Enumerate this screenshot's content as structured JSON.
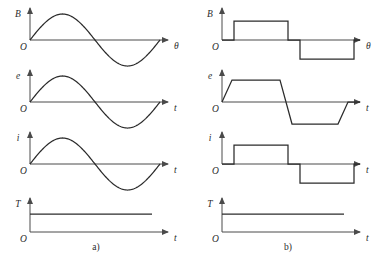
{
  "figure": {
    "width": 387,
    "height": 259,
    "background": "#ffffff",
    "curve_color": "#2b2b2b",
    "axis_color": "#4a4a4a"
  },
  "captions": [
    {
      "id": "caption-a",
      "label": "a)",
      "x": 96,
      "y": 250
    },
    {
      "id": "caption-b",
      "label": "b)",
      "x": 288,
      "y": 250
    }
  ],
  "origin_label": "O",
  "panels": [
    {
      "id": "panel-a-B",
      "column": "a",
      "y_label": "B",
      "x_label": "θ",
      "origin": {
        "x": 30,
        "y": 40
      },
      "x_axis_end": 168,
      "y_axis_top": 8,
      "wave": "sine",
      "amplitude": 26,
      "period": 130,
      "wave_start": 30,
      "wave_end": 160
    },
    {
      "id": "panel-a-e",
      "column": "a",
      "y_label": "e",
      "x_label": "t",
      "origin": {
        "x": 30,
        "y": 102
      },
      "x_axis_end": 168,
      "y_axis_top": 70,
      "wave": "sine",
      "amplitude": 26,
      "period": 130,
      "wave_start": 30,
      "wave_end": 160
    },
    {
      "id": "panel-a-i",
      "column": "a",
      "y_label": "i",
      "x_label": "t",
      "origin": {
        "x": 30,
        "y": 164
      },
      "x_axis_end": 168,
      "y_axis_top": 132,
      "wave": "sine",
      "amplitude": 26,
      "period": 130,
      "wave_start": 30,
      "wave_end": 160
    },
    {
      "id": "panel-a-T",
      "column": "a",
      "y_label": "T",
      "x_label": "t",
      "origin": {
        "x": 30,
        "y": 232
      },
      "x_axis_end": 168,
      "y_axis_top": 198,
      "wave": "constant",
      "level": 18,
      "wave_start": 30,
      "wave_end": 152
    },
    {
      "id": "panel-b-B",
      "column": "b",
      "y_label": "B",
      "x_label": "θ",
      "origin": {
        "x": 222,
        "y": 40
      },
      "x_axis_end": 360,
      "y_axis_top": 8,
      "wave": "square",
      "amplitude": 19,
      "pos_start": 234,
      "pos_end": 288,
      "neg_start": 300,
      "neg_end": 354
    },
    {
      "id": "panel-b-e",
      "column": "b",
      "y_label": "e",
      "x_label": "t",
      "origin": {
        "x": 222,
        "y": 102
      },
      "x_axis_end": 360,
      "y_axis_top": 70,
      "wave": "trapezoid",
      "amplitude": 22,
      "points": "222,102 232,80 280,80 292,124 338,124 348,102 360,102"
    },
    {
      "id": "panel-b-i",
      "column": "b",
      "y_label": "i",
      "x_label": "t",
      "origin": {
        "x": 222,
        "y": 164
      },
      "x_axis_end": 360,
      "y_axis_top": 132,
      "wave": "square",
      "amplitude": 19,
      "pos_start": 234,
      "pos_end": 288,
      "neg_start": 300,
      "neg_end": 354
    },
    {
      "id": "panel-b-T",
      "column": "b",
      "y_label": "T",
      "x_label": "t",
      "origin": {
        "x": 222,
        "y": 232
      },
      "x_axis_end": 360,
      "y_axis_top": 198,
      "wave": "constant",
      "level": 18,
      "wave_start": 222,
      "wave_end": 344
    }
  ],
  "chart_data": {
    "type": "line",
    "title": "",
    "xlabel": "",
    "ylabel": "",
    "subfigures": [
      {
        "name": "a)",
        "description": "Sinusoidal field, emf, current and constant torque waveforms",
        "traces": [
          {
            "name": "B",
            "xlabel": "θ",
            "shape": "sine",
            "periods": 1,
            "amplitude": 1
          },
          {
            "name": "e",
            "xlabel": "t",
            "shape": "sine",
            "periods": 1,
            "amplitude": 1
          },
          {
            "name": "i",
            "xlabel": "t",
            "shape": "sine",
            "periods": 1,
            "amplitude": 1
          },
          {
            "name": "T",
            "xlabel": "t",
            "shape": "constant",
            "value": 1
          }
        ]
      },
      {
        "name": "b)",
        "description": "Square/trapezoidal field, emf, current and constant torque waveforms",
        "traces": [
          {
            "name": "B",
            "xlabel": "θ",
            "shape": "square",
            "periods": 1,
            "amplitude": 1
          },
          {
            "name": "e",
            "xlabel": "t",
            "shape": "trapezoid",
            "periods": 1,
            "amplitude": 1
          },
          {
            "name": "i",
            "xlabel": "t",
            "shape": "square",
            "periods": 1,
            "amplitude": 1
          },
          {
            "name": "T",
            "xlabel": "t",
            "shape": "constant",
            "value": 1
          }
        ]
      }
    ]
  }
}
